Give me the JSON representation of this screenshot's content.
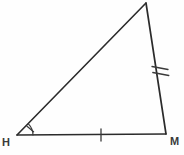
{
  "figure": {
    "kind": "geometry-diagram",
    "shape": "triangle",
    "background_color": "#fefefe",
    "stroke_color": "#2b2b2b",
    "label_color": "#3a3a3a",
    "stroke_width": 1.6,
    "canvas": {
      "width": 184,
      "height": 155
    }
  },
  "vertices": [
    {
      "id": "H",
      "label": "H",
      "x": 17,
      "y": 135,
      "label_x": 2,
      "label_y": 137
    },
    {
      "id": "M",
      "label": "M",
      "x": 166,
      "y": 134,
      "label_x": 170,
      "label_y": 136
    },
    {
      "id": "A",
      "label": "",
      "x": 146,
      "y": 3,
      "label_x": 0,
      "label_y": 0
    }
  ],
  "sides": [
    {
      "id": "HM",
      "from": "H",
      "to": "M",
      "tick_count": 1,
      "tick_label": "single-tick"
    },
    {
      "id": "MA",
      "from": "M",
      "to": "A",
      "tick_count": 2,
      "tick_label": "double-tick"
    },
    {
      "id": "AH",
      "from": "A",
      "to": "H",
      "tick_count": 0,
      "tick_label": "none"
    }
  ],
  "angle_marks": [
    {
      "at": "H",
      "arc_radius": 14,
      "tick_count": 1,
      "label": "angle-arc-h"
    }
  ],
  "labels": {
    "h": "H",
    "m": "M"
  }
}
